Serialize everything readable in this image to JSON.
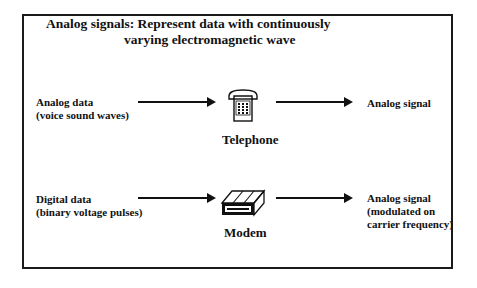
{
  "title": {
    "line1": "Analog signals: Represent data with continuously",
    "line2": "varying electromagnetic wave"
  },
  "rows": [
    {
      "input_line1": "Analog data",
      "input_line2": "(voice sound waves)",
      "device_icon": "telephone-icon",
      "device_label": "Telephone",
      "output_line1": "Analog signal",
      "output_line2": "",
      "output_line3": ""
    },
    {
      "input_line1": "Digital data",
      "input_line2": "(binary voltage pulses)",
      "device_icon": "modem-icon",
      "device_label": "Modem",
      "output_line1": "Analog signal",
      "output_line2": "(modulated on",
      "output_line3": "carrier frequency)"
    }
  ]
}
